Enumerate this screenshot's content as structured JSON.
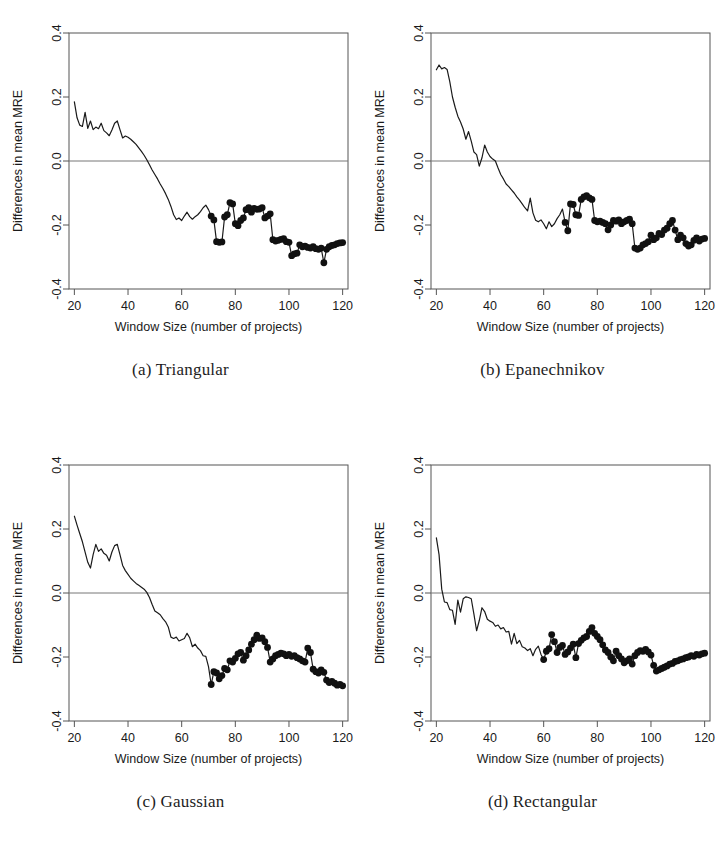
{
  "figure": {
    "layout": "2x2 grid of line charts",
    "panel_order": [
      "a",
      "b",
      "c",
      "d"
    ]
  },
  "chart_data": [
    {
      "type": "line",
      "id": "a",
      "title": "(a) Triangular",
      "caption": "(a) Triangular",
      "xlabel": "Window Size (number of projects)",
      "ylabel": "Differences in mean MRE",
      "xlim": [
        18,
        122
      ],
      "ylim": [
        -0.4,
        0.4
      ],
      "xticks": [
        20,
        40,
        60,
        80,
        100,
        120
      ],
      "yticks": [
        -0.4,
        -0.2,
        0.0,
        0.2,
        0.4
      ],
      "ytick_labels": [
        "-0.4",
        "-0.2",
        "0.0",
        "0.2",
        "0.4"
      ],
      "xtick_labels": [
        "20",
        "40",
        "60",
        "80",
        "100",
        "120"
      ],
      "grid": false,
      "legend": "none",
      "zero_reference_line": 0.0,
      "marker_start_x": 71,
      "x": [
        20,
        21,
        22,
        23,
        24,
        25,
        26,
        27,
        28,
        29,
        30,
        31,
        32,
        33,
        34,
        35,
        36,
        37,
        38,
        39,
        40,
        41,
        42,
        43,
        44,
        45,
        46,
        47,
        48,
        49,
        50,
        51,
        52,
        53,
        54,
        55,
        56,
        57,
        58,
        59,
        60,
        61,
        62,
        63,
        64,
        65,
        66,
        67,
        68,
        69,
        70,
        71,
        72,
        73,
        74,
        75,
        76,
        77,
        78,
        79,
        80,
        81,
        82,
        83,
        84,
        85,
        86,
        87,
        88,
        89,
        90,
        91,
        92,
        93,
        94,
        95,
        96,
        97,
        98,
        99,
        100,
        101,
        102,
        103,
        104,
        105,
        106,
        107,
        108,
        109,
        110,
        111,
        112,
        113,
        114,
        115,
        116,
        117,
        118,
        119,
        120
      ],
      "values": [
        0.185,
        0.135,
        0.112,
        0.108,
        0.152,
        0.102,
        0.125,
        0.098,
        0.106,
        0.101,
        0.118,
        0.095,
        0.088,
        0.079,
        0.097,
        0.118,
        0.125,
        0.098,
        0.072,
        0.078,
        0.074,
        0.068,
        0.06,
        0.052,
        0.041,
        0.03,
        0.018,
        0.004,
        -0.012,
        -0.028,
        -0.042,
        -0.056,
        -0.072,
        -0.086,
        -0.102,
        -0.12,
        -0.142,
        -0.168,
        -0.183,
        -0.178,
        -0.186,
        -0.172,
        -0.16,
        -0.174,
        -0.182,
        -0.174,
        -0.168,
        -0.158,
        -0.146,
        -0.138,
        -0.152,
        -0.172,
        -0.184,
        -0.252,
        -0.254,
        -0.253,
        -0.175,
        -0.168,
        -0.13,
        -0.134,
        -0.196,
        -0.202,
        -0.186,
        -0.178,
        -0.152,
        -0.146,
        -0.16,
        -0.148,
        -0.151,
        -0.15,
        -0.146,
        -0.178,
        -0.172,
        -0.165,
        -0.246,
        -0.25,
        -0.248,
        -0.245,
        -0.243,
        -0.252,
        -0.254,
        -0.296,
        -0.29,
        -0.288,
        -0.262,
        -0.268,
        -0.266,
        -0.27,
        -0.272,
        -0.268,
        -0.274,
        -0.276,
        -0.272,
        -0.318,
        -0.276,
        -0.268,
        -0.264,
        -0.262,
        -0.258,
        -0.256,
        -0.255
      ]
    },
    {
      "type": "line",
      "id": "b",
      "title": "(b) Epanechnikov",
      "caption": "(b) Epanechnikov",
      "xlabel": "Window Size (number of projects)",
      "ylabel": "Differences in mean MRE",
      "xlim": [
        18,
        122
      ],
      "ylim": [
        -0.4,
        0.4
      ],
      "xticks": [
        20,
        40,
        60,
        80,
        100,
        120
      ],
      "yticks": [
        -0.4,
        -0.2,
        0.0,
        0.2,
        0.4
      ],
      "ytick_labels": [
        "-0.4",
        "-0.2",
        "0.0",
        "0.2",
        "0.4"
      ],
      "xtick_labels": [
        "20",
        "40",
        "60",
        "80",
        "100",
        "120"
      ],
      "grid": false,
      "legend": "none",
      "zero_reference_line": 0.0,
      "marker_start_x": 68,
      "x": [
        20,
        21,
        22,
        23,
        24,
        25,
        26,
        27,
        28,
        29,
        30,
        31,
        32,
        33,
        34,
        35,
        36,
        37,
        38,
        39,
        40,
        41,
        42,
        43,
        44,
        45,
        46,
        47,
        48,
        49,
        50,
        51,
        52,
        53,
        54,
        55,
        56,
        57,
        58,
        59,
        60,
        61,
        62,
        63,
        64,
        65,
        66,
        67,
        68,
        69,
        70,
        71,
        72,
        73,
        74,
        75,
        76,
        77,
        78,
        79,
        80,
        81,
        82,
        83,
        84,
        85,
        86,
        87,
        88,
        89,
        90,
        91,
        92,
        93,
        94,
        95,
        96,
        97,
        98,
        99,
        100,
        101,
        102,
        103,
        104,
        105,
        106,
        107,
        108,
        109,
        110,
        111,
        112,
        113,
        114,
        115,
        116,
        117,
        118,
        119,
        120
      ],
      "values": [
        0.285,
        0.3,
        0.288,
        0.292,
        0.286,
        0.248,
        0.2,
        0.168,
        0.14,
        0.122,
        0.1,
        0.068,
        0.092,
        0.062,
        0.028,
        0.02,
        -0.016,
        0.01,
        0.05,
        0.028,
        0.014,
        0.006,
        0.0,
        -0.022,
        -0.042,
        -0.056,
        -0.072,
        -0.08,
        -0.09,
        -0.1,
        -0.112,
        -0.122,
        -0.134,
        -0.146,
        -0.156,
        -0.116,
        -0.162,
        -0.185,
        -0.19,
        -0.184,
        -0.196,
        -0.212,
        -0.19,
        -0.205,
        -0.196,
        -0.18,
        -0.168,
        -0.15,
        -0.192,
        -0.218,
        -0.134,
        -0.136,
        -0.168,
        -0.17,
        -0.12,
        -0.112,
        -0.108,
        -0.115,
        -0.12,
        -0.186,
        -0.19,
        -0.188,
        -0.192,
        -0.196,
        -0.215,
        -0.2,
        -0.186,
        -0.188,
        -0.184,
        -0.196,
        -0.19,
        -0.186,
        -0.182,
        -0.196,
        -0.272,
        -0.276,
        -0.272,
        -0.262,
        -0.258,
        -0.252,
        -0.232,
        -0.246,
        -0.24,
        -0.226,
        -0.23,
        -0.216,
        -0.21,
        -0.196,
        -0.186,
        -0.216,
        -0.246,
        -0.232,
        -0.24,
        -0.258,
        -0.266,
        -0.262,
        -0.248,
        -0.24,
        -0.25,
        -0.244,
        -0.242
      ]
    },
    {
      "type": "line",
      "id": "c",
      "title": "(c) Gaussian",
      "caption": "(c) Gaussian",
      "xlabel": "Window Size (number of projects)",
      "ylabel": "Differences in mean MRE",
      "xlim": [
        18,
        122
      ],
      "ylim": [
        -0.4,
        0.4
      ],
      "xticks": [
        20,
        40,
        60,
        80,
        100,
        120
      ],
      "yticks": [
        -0.4,
        -0.2,
        0.0,
        0.2,
        0.4
      ],
      "ytick_labels": [
        "-0.4",
        "-0.2",
        "0.0",
        "0.2",
        "0.4"
      ],
      "xtick_labels": [
        "20",
        "40",
        "60",
        "80",
        "100",
        "120"
      ],
      "grid": false,
      "legend": "none",
      "zero_reference_line": 0.0,
      "marker_start_x": 71,
      "x": [
        20,
        21,
        22,
        23,
        24,
        25,
        26,
        27,
        28,
        29,
        30,
        31,
        32,
        33,
        34,
        35,
        36,
        37,
        38,
        39,
        40,
        41,
        42,
        43,
        44,
        45,
        46,
        47,
        48,
        49,
        50,
        51,
        52,
        53,
        54,
        55,
        56,
        57,
        58,
        59,
        60,
        61,
        62,
        63,
        64,
        65,
        66,
        67,
        68,
        69,
        70,
        71,
        72,
        73,
        74,
        75,
        76,
        77,
        78,
        79,
        80,
        81,
        82,
        83,
        84,
        85,
        86,
        87,
        88,
        89,
        90,
        91,
        92,
        93,
        94,
        95,
        96,
        97,
        98,
        99,
        100,
        101,
        102,
        103,
        104,
        105,
        106,
        107,
        108,
        109,
        110,
        111,
        112,
        113,
        114,
        115,
        116,
        117,
        118,
        119,
        120
      ],
      "values": [
        0.24,
        0.212,
        0.186,
        0.16,
        0.128,
        0.096,
        0.078,
        0.12,
        0.152,
        0.13,
        0.138,
        0.124,
        0.118,
        0.1,
        0.128,
        0.148,
        0.152,
        0.12,
        0.086,
        0.07,
        0.058,
        0.046,
        0.038,
        0.03,
        0.024,
        0.018,
        0.012,
        0.002,
        -0.014,
        -0.036,
        -0.056,
        -0.062,
        -0.068,
        -0.08,
        -0.09,
        -0.106,
        -0.138,
        -0.142,
        -0.138,
        -0.15,
        -0.146,
        -0.142,
        -0.126,
        -0.14,
        -0.168,
        -0.16,
        -0.172,
        -0.18,
        -0.196,
        -0.198,
        -0.23,
        -0.286,
        -0.246,
        -0.25,
        -0.268,
        -0.258,
        -0.236,
        -0.24,
        -0.212,
        -0.216,
        -0.204,
        -0.19,
        -0.186,
        -0.21,
        -0.196,
        -0.178,
        -0.16,
        -0.146,
        -0.132,
        -0.142,
        -0.14,
        -0.152,
        -0.17,
        -0.216,
        -0.206,
        -0.196,
        -0.192,
        -0.188,
        -0.19,
        -0.196,
        -0.192,
        -0.198,
        -0.196,
        -0.202,
        -0.206,
        -0.212,
        -0.216,
        -0.172,
        -0.186,
        -0.238,
        -0.246,
        -0.25,
        -0.24,
        -0.248,
        -0.272,
        -0.28,
        -0.276,
        -0.282,
        -0.288,
        -0.286,
        -0.29
      ]
    },
    {
      "type": "line",
      "id": "d",
      "title": "(d) Rectangular",
      "caption": "(d) Rectangular",
      "xlabel": "Window Size (number of projects)",
      "ylabel": "Differences in mean MRE",
      "xlim": [
        18,
        122
      ],
      "ylim": [
        -0.4,
        0.4
      ],
      "xticks": [
        20,
        40,
        60,
        80,
        100,
        120
      ],
      "yticks": [
        -0.4,
        -0.2,
        0.0,
        0.2,
        0.4
      ],
      "ytick_labels": [
        "-0.4",
        "-0.2",
        "0.0",
        "0.2",
        "0.4"
      ],
      "xtick_labels": [
        "20",
        "40",
        "60",
        "80",
        "100",
        "120"
      ],
      "grid": false,
      "legend": "none",
      "zero_reference_line": 0.0,
      "marker_start_x": 60,
      "x": [
        20,
        21,
        22,
        23,
        24,
        25,
        26,
        27,
        28,
        29,
        30,
        31,
        32,
        33,
        34,
        35,
        36,
        37,
        38,
        39,
        40,
        41,
        42,
        43,
        44,
        45,
        46,
        47,
        48,
        49,
        50,
        51,
        52,
        53,
        54,
        55,
        56,
        57,
        58,
        59,
        60,
        61,
        62,
        63,
        64,
        65,
        66,
        67,
        68,
        69,
        70,
        71,
        72,
        73,
        74,
        75,
        76,
        77,
        78,
        79,
        80,
        81,
        82,
        83,
        84,
        85,
        86,
        87,
        88,
        89,
        90,
        91,
        92,
        93,
        94,
        95,
        96,
        97,
        98,
        99,
        100,
        101,
        102,
        103,
        104,
        105,
        106,
        107,
        108,
        109,
        110,
        111,
        112,
        113,
        114,
        115,
        116,
        117,
        118,
        119,
        120
      ],
      "values": [
        0.172,
        0.12,
        0.012,
        -0.028,
        -0.03,
        -0.052,
        -0.054,
        -0.098,
        -0.022,
        -0.06,
        -0.018,
        -0.012,
        -0.014,
        -0.018,
        -0.066,
        -0.118,
        -0.086,
        -0.046,
        -0.058,
        -0.082,
        -0.088,
        -0.092,
        -0.104,
        -0.1,
        -0.112,
        -0.108,
        -0.122,
        -0.12,
        -0.16,
        -0.126,
        -0.158,
        -0.148,
        -0.168,
        -0.172,
        -0.18,
        -0.174,
        -0.196,
        -0.176,
        -0.166,
        -0.192,
        -0.208,
        -0.182,
        -0.174,
        -0.13,
        -0.152,
        -0.186,
        -0.17,
        -0.164,
        -0.192,
        -0.184,
        -0.172,
        -0.16,
        -0.202,
        -0.158,
        -0.148,
        -0.14,
        -0.136,
        -0.12,
        -0.108,
        -0.126,
        -0.136,
        -0.146,
        -0.162,
        -0.178,
        -0.186,
        -0.2,
        -0.212,
        -0.182,
        -0.196,
        -0.206,
        -0.218,
        -0.212,
        -0.206,
        -0.222,
        -0.196,
        -0.186,
        -0.18,
        -0.182,
        -0.176,
        -0.184,
        -0.194,
        -0.226,
        -0.244,
        -0.24,
        -0.236,
        -0.232,
        -0.228,
        -0.222,
        -0.22,
        -0.214,
        -0.212,
        -0.208,
        -0.206,
        -0.202,
        -0.2,
        -0.196,
        -0.198,
        -0.192,
        -0.194,
        -0.19,
        -0.188
      ]
    }
  ],
  "style": {
    "line_color": "#1a1a1a",
    "marker_color": "#111111",
    "axis_color": "#555555",
    "zero_line_color": "#777777",
    "background": "#ffffff"
  }
}
